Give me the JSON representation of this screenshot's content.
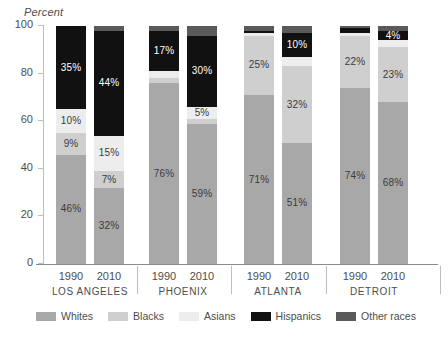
{
  "chart_data": {
    "type": "bar",
    "title": "",
    "subtitle": "",
    "ylabel": "Percent",
    "xlabel": "",
    "ylim": [
      0,
      100
    ],
    "yticks": [
      0,
      20,
      40,
      60,
      80,
      100
    ],
    "grid": false,
    "stacked": true,
    "legend_position": "bottom",
    "legend": [
      "Whites",
      "Blacks",
      "Asians",
      "Hispanics",
      "Other races"
    ],
    "colors": {
      "Whites": "#a8a8a8",
      "Blacks": "#cfcfcf",
      "Asians": "#ededed",
      "Hispanics": "#111111",
      "Other races": "#5a5a5a"
    },
    "groups": [
      "LOS ANGELES",
      "PHOENIX",
      "ATLANTA",
      "DETROIT"
    ],
    "categories": [
      "1990",
      "2010",
      "1990",
      "2010",
      "1990",
      "2010",
      "1990",
      "2010"
    ],
    "series": [
      {
        "name": "Whites",
        "values": [
          46,
          32,
          76,
          59,
          71,
          51,
          74,
          68
        ]
      },
      {
        "name": "Blacks",
        "values": [
          9,
          7,
          2,
          2,
          25,
          32,
          22,
          23
        ]
      },
      {
        "name": "Asians",
        "values": [
          10,
          15,
          3,
          5,
          1,
          4,
          1,
          3
        ]
      },
      {
        "name": "Hispanics",
        "values": [
          35,
          44,
          17,
          30,
          1,
          10,
          2,
          4
        ]
      },
      {
        "name": "Other races",
        "values": [
          0,
          2,
          2,
          4,
          2,
          3,
          1,
          2
        ]
      }
    ],
    "bars": [
      {
        "group": "LOS ANGELES",
        "year": "1990",
        "segments": [
          {
            "series": "Whites",
            "value": 46,
            "label": "46%",
            "label_color": "dark"
          },
          {
            "series": "Blacks",
            "value": 9,
            "label": "9%",
            "label_color": "dark"
          },
          {
            "series": "Asians",
            "value": 10,
            "label": "10%",
            "label_color": "dark"
          },
          {
            "series": "Hispanics",
            "value": 35,
            "label": "35%",
            "label_color": "light"
          },
          {
            "series": "Other races",
            "value": 0,
            "label": "",
            "label_color": "light"
          }
        ]
      },
      {
        "group": "LOS ANGELES",
        "year": "2010",
        "segments": [
          {
            "series": "Whites",
            "value": 32,
            "label": "32%",
            "label_color": "dark"
          },
          {
            "series": "Blacks",
            "value": 7,
            "label": "7%",
            "label_color": "dark"
          },
          {
            "series": "Asians",
            "value": 15,
            "label": "15%",
            "label_color": "dark"
          },
          {
            "series": "Hispanics",
            "value": 44,
            "label": "44%",
            "label_color": "light"
          },
          {
            "series": "Other races",
            "value": 2,
            "label": "",
            "label_color": "light"
          }
        ]
      },
      {
        "group": "PHOENIX",
        "year": "1990",
        "segments": [
          {
            "series": "Whites",
            "value": 76,
            "label": "76%",
            "label_color": "dark"
          },
          {
            "series": "Blacks",
            "value": 2,
            "label": "",
            "label_color": "dark"
          },
          {
            "series": "Asians",
            "value": 3,
            "label": "",
            "label_color": "dark"
          },
          {
            "series": "Hispanics",
            "value": 17,
            "label": "17%",
            "label_color": "light"
          },
          {
            "series": "Other races",
            "value": 2,
            "label": "",
            "label_color": "light"
          }
        ]
      },
      {
        "group": "PHOENIX",
        "year": "2010",
        "segments": [
          {
            "series": "Whites",
            "value": 59,
            "label": "59%",
            "label_color": "dark"
          },
          {
            "series": "Blacks",
            "value": 2,
            "label": "",
            "label_color": "dark"
          },
          {
            "series": "Asians",
            "value": 5,
            "label": "5%",
            "label_color": "dark"
          },
          {
            "series": "Hispanics",
            "value": 30,
            "label": "30%",
            "label_color": "light"
          },
          {
            "series": "Other races",
            "value": 4,
            "label": "",
            "label_color": "light"
          }
        ]
      },
      {
        "group": "ATLANTA",
        "year": "1990",
        "segments": [
          {
            "series": "Whites",
            "value": 71,
            "label": "71%",
            "label_color": "dark"
          },
          {
            "series": "Blacks",
            "value": 25,
            "label": "25%",
            "label_color": "dark"
          },
          {
            "series": "Asians",
            "value": 1,
            "label": "",
            "label_color": "dark"
          },
          {
            "series": "Hispanics",
            "value": 1,
            "label": "",
            "label_color": "light"
          },
          {
            "series": "Other races",
            "value": 2,
            "label": "",
            "label_color": "light"
          }
        ]
      },
      {
        "group": "ATLANTA",
        "year": "2010",
        "segments": [
          {
            "series": "Whites",
            "value": 51,
            "label": "51%",
            "label_color": "dark"
          },
          {
            "series": "Blacks",
            "value": 32,
            "label": "32%",
            "label_color": "dark"
          },
          {
            "series": "Asians",
            "value": 4,
            "label": "",
            "label_color": "dark"
          },
          {
            "series": "Hispanics",
            "value": 10,
            "label": "10%",
            "label_color": "light"
          },
          {
            "series": "Other races",
            "value": 3,
            "label": "",
            "label_color": "light"
          }
        ]
      },
      {
        "group": "DETROIT",
        "year": "1990",
        "segments": [
          {
            "series": "Whites",
            "value": 74,
            "label": "74%",
            "label_color": "dark"
          },
          {
            "series": "Blacks",
            "value": 22,
            "label": "22%",
            "label_color": "dark"
          },
          {
            "series": "Asians",
            "value": 1,
            "label": "",
            "label_color": "dark"
          },
          {
            "series": "Hispanics",
            "value": 2,
            "label": "",
            "label_color": "light"
          },
          {
            "series": "Other races",
            "value": 1,
            "label": "",
            "label_color": "light"
          }
        ]
      },
      {
        "group": "DETROIT",
        "year": "2010",
        "segments": [
          {
            "series": "Whites",
            "value": 68,
            "label": "68%",
            "label_color": "dark"
          },
          {
            "series": "Blacks",
            "value": 23,
            "label": "23%",
            "label_color": "dark"
          },
          {
            "series": "Asians",
            "value": 3,
            "label": "",
            "label_color": "dark"
          },
          {
            "series": "Hispanics",
            "value": 4,
            "label": "4%",
            "label_color": "light"
          },
          {
            "series": "Other races",
            "value": 2,
            "label": "",
            "label_color": "light"
          }
        ]
      }
    ]
  }
}
